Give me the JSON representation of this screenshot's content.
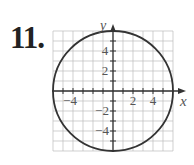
{
  "problem_number": "11.",
  "chart_data": {
    "type": "line",
    "title": "",
    "equation": "x^2 + y^2 = 36",
    "center": [
      0,
      0
    ],
    "radius": 6,
    "xlabel": "x",
    "ylabel": "y",
    "xlim": [
      -6,
      6
    ],
    "ylim": [
      -6,
      6
    ],
    "grid": true,
    "x_tick_labels": [
      "-4",
      "2",
      "4"
    ],
    "y_tick_labels": [
      "4",
      "2",
      "-2",
      "-4"
    ],
    "colors": {
      "curve": "#333333",
      "grid": "#bbbbbb",
      "axis": "#333333"
    }
  }
}
